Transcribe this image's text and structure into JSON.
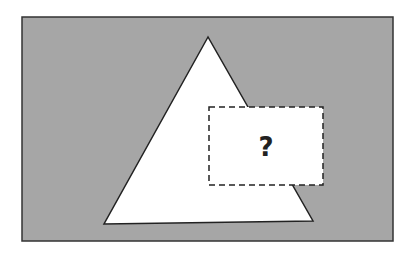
{
  "diagram": {
    "background_color": "#a6a6a6",
    "shape": "triangle",
    "shape_fill": "#ffffff",
    "hidden_region_label": "?",
    "hidden_region_style": "dashed"
  }
}
